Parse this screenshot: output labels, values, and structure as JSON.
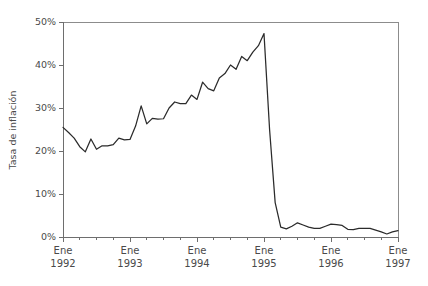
{
  "chart_data": {
    "type": "line",
    "title": "",
    "xlabel": "",
    "ylabel": "Tasa de inflación",
    "ylim": [
      0,
      50
    ],
    "yticks": [
      0,
      10,
      20,
      30,
      40,
      50
    ],
    "ytick_labels": [
      "0%",
      "10%",
      "20%",
      "30%",
      "40%",
      "50%"
    ],
    "xlim": [
      0,
      60
    ],
    "xticks": [
      0,
      12,
      24,
      36,
      48,
      60
    ],
    "xtick_labels": [
      {
        "month": "Ene",
        "year": "1992"
      },
      {
        "month": "Ene",
        "year": "1993"
      },
      {
        "month": "Ene",
        "year": "1994"
      },
      {
        "month": "Ene",
        "year": "1995"
      },
      {
        "month": "Ene",
        "year": "1996"
      },
      {
        "month": "Ene",
        "year": "1997"
      }
    ],
    "minor_xticks": [
      3,
      6,
      9,
      15,
      18,
      21,
      27,
      30,
      33,
      39,
      42,
      45,
      51,
      54,
      57
    ],
    "grid": false,
    "legend": null,
    "line_color": "#2b2b2b",
    "series": [
      {
        "name": "Tasa de inflación",
        "x": [
          0,
          1,
          2,
          3,
          4,
          5,
          6,
          7,
          8,
          9,
          10,
          11,
          12,
          13,
          14,
          15,
          16,
          17,
          18,
          19,
          20,
          21,
          22,
          23,
          24,
          25,
          26,
          27,
          28,
          29,
          30,
          31,
          32,
          33,
          34,
          35,
          36,
          37,
          38,
          39,
          40,
          41,
          42,
          43,
          44,
          45,
          46,
          47,
          48,
          49,
          50,
          51,
          52,
          53,
          54,
          55,
          56,
          57,
          58,
          59,
          60
        ],
        "values": [
          25.5,
          24.3,
          23.0,
          21.0,
          19.8,
          22.8,
          20.4,
          21.2,
          21.2,
          21.5,
          23.0,
          22.6,
          22.7,
          25.8,
          30.5,
          26.3,
          27.6,
          27.4,
          27.5,
          30.0,
          31.4,
          31.0,
          31.0,
          33.0,
          32.0,
          36.0,
          34.5,
          34.0,
          37.0,
          38.0,
          40.0,
          39.0,
          42.0,
          41.0,
          43.0,
          44.5,
          47.3,
          25.0,
          8.0,
          2.3,
          1.9,
          2.5,
          3.3,
          2.8,
          2.3,
          2.0,
          2.0,
          2.5,
          3.0,
          2.9,
          2.7,
          1.8,
          1.7,
          2.0,
          2.0,
          2.0,
          1.6,
          1.2,
          0.7,
          1.2,
          1.5
        ],
        "units": "percent_per_month"
      }
    ],
    "annotations": []
  }
}
